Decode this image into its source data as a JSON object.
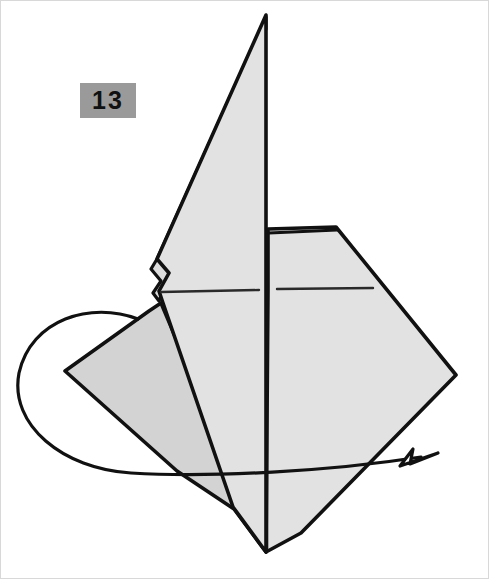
{
  "document": {
    "kind": "origami-diagram",
    "step_badge": {
      "label": "13",
      "background_color": "#9a9a9a",
      "text_color": "#111111"
    }
  },
  "palette": {
    "paper_front": "#e2e2e2",
    "paper_back": "#d3d3d3",
    "paper_shadow": "#dcdcdc",
    "outline": "#111111",
    "page_background": "#ffffff"
  },
  "figure": {
    "name": "folded-paper-model",
    "apex_point": "265,551",
    "top_tip": "265,14",
    "right_corner": "455,374",
    "shapes": [
      {
        "name": "right-panel",
        "fill": "paper_front",
        "points": "267,228 335,226 455,374 300,532 265,551 267,290"
      },
      {
        "name": "center-spike",
        "fill": "paper_front",
        "points": "265,14 265,551 232,506 162,302 158,290 168,272 156,258"
      },
      {
        "name": "spike-underlayer",
        "fill": "paper_shadow",
        "points": "265,16 156,258 150,268 160,280 152,292 158,300 265,28"
      },
      {
        "name": "left-flap",
        "fill": "paper_back",
        "points": "148,310 64,370 176,470 233,508 265,551 160,302"
      }
    ],
    "fold_lines": [
      {
        "name": "center-vertical-crease",
        "path": "M266,230 L266,548"
      },
      {
        "name": "left-horizontal-crease",
        "path": "M160,291 L258,289"
      },
      {
        "name": "right-horizontal-crease",
        "path": "M276,288 L372,287"
      },
      {
        "name": "right-panel-top-edge",
        "path": "M268,232 L336,229"
      }
    ],
    "arrow": {
      "name": "rotate-arrow",
      "type": "curved-loop-with-arrowhead",
      "curve_path": "M137,318 C90,300 30,318 18,372 C8,424 62,468 130,472 C210,477 330,470 420,456",
      "head_points": "437,455 398,464 414,447 411,462"
    }
  }
}
